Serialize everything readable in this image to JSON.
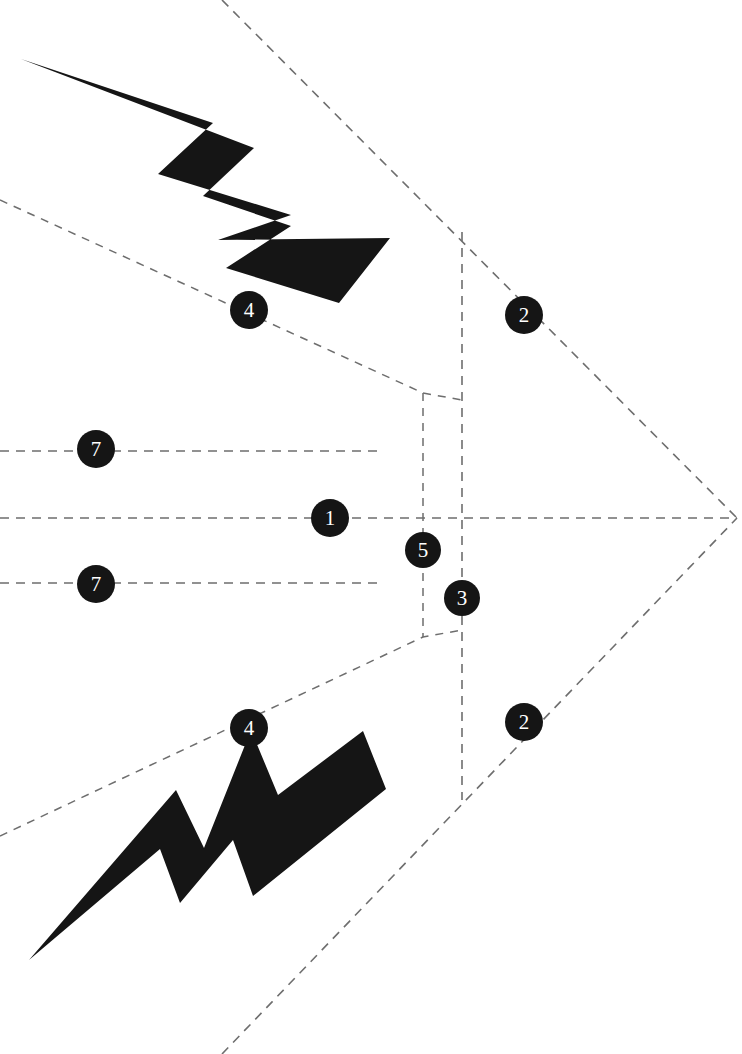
{
  "canvas": {
    "width": 742,
    "height": 1054,
    "background": "#ffffff",
    "ink": "#151515",
    "dash_color": "#6e6e6e"
  },
  "diagram": {
    "vertex": {
      "x": 737,
      "y": 518
    },
    "symmetry_axis_y": 518
  },
  "callouts": [
    {
      "label": "4",
      "x": 249,
      "y": 310,
      "r": 19,
      "font_size": 21,
      "name": "callout-4-upper"
    },
    {
      "label": "2",
      "x": 524,
      "y": 315,
      "r": 19,
      "font_size": 21,
      "name": "callout-2-upper"
    },
    {
      "label": "7",
      "x": 96,
      "y": 449,
      "r": 19,
      "font_size": 21,
      "name": "callout-7-upper"
    },
    {
      "label": "1",
      "x": 330,
      "y": 518,
      "r": 19,
      "font_size": 21,
      "name": "callout-1-center"
    },
    {
      "label": "7",
      "x": 96,
      "y": 584,
      "r": 19,
      "font_size": 21,
      "name": "callout-7-lower"
    },
    {
      "label": "5",
      "x": 423,
      "y": 550,
      "r": 18,
      "font_size": 21,
      "name": "callout-5"
    },
    {
      "label": "3",
      "x": 462,
      "y": 598,
      "r": 18,
      "font_size": 21,
      "name": "callout-3"
    },
    {
      "label": "4",
      "x": 249,
      "y": 728,
      "r": 19,
      "font_size": 21,
      "name": "callout-4-lower"
    },
    {
      "label": "2",
      "x": 524,
      "y": 722,
      "r": 19,
      "font_size": 21,
      "name": "callout-2-lower"
    }
  ],
  "construction_lines": [
    {
      "name": "center-axis-line",
      "points": "0,518 737,518",
      "dash": "9 7",
      "width": 1.6
    },
    {
      "name": "upper-offset-line",
      "points": "0,451 383,451",
      "dash": "9 7",
      "width": 1.6
    },
    {
      "name": "lower-offset-line",
      "points": "0,583 383,583",
      "dash": "9 7",
      "width": 1.6
    },
    {
      "name": "upper-long-diagonal",
      "points": "222,0 737,518",
      "dash": "9 7",
      "width": 1.6
    },
    {
      "name": "lower-long-diagonal",
      "points": "222,1054 737,518",
      "dash": "9 7",
      "width": 1.6
    },
    {
      "name": "upper-taper-diagonal",
      "points": "0,200 423,393 462,400",
      "dash": "8 7",
      "width": 1.5
    },
    {
      "name": "lower-taper-diagonal",
      "points": "0,836 423,637 462,630",
      "dash": "8 7",
      "width": 1.5
    },
    {
      "name": "outer-vertical-line",
      "points": "462,232 462,800",
      "dash": "9 7",
      "width": 1.6
    },
    {
      "name": "inner-vertical-line",
      "points": "423,393 423,637",
      "dash": "8 7",
      "width": 1.5
    }
  ],
  "bolts": [
    {
      "name": "lightning-bolt-upper",
      "points": "21,59 213,123 158,174 291,215 218,240 390,238 339,303 226,268 291,226 203,196 254,148"
    },
    {
      "name": "lightning-bolt-lower",
      "points": "29,960 176,790 204,848 251,730 278,795 363,731 386,789 253,896 233,840 180,903 160,849"
    }
  ]
}
